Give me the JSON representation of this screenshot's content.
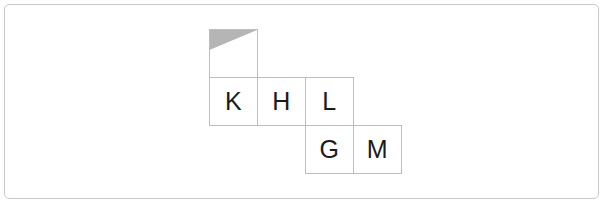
{
  "frame": {
    "border_color": "#c9c9c9",
    "background_color": "#ffffff",
    "corner_radius_px": 5
  },
  "board": {
    "cell_size_px": 49,
    "columns": 4,
    "rows": 3,
    "cell_border_color": "#bdbdbd",
    "cell_fill_color": "#ffffff",
    "letter_color": "#1b1b1b",
    "shade_color": "#b5b5b5",
    "cells": [
      {
        "id": "cell-r0c0",
        "row": 0,
        "col": 0,
        "letter": "",
        "shaded_corner": "top-left",
        "name": "shaded-marker-cell"
      },
      {
        "id": "cell-r1c0",
        "row": 1,
        "col": 0,
        "letter": "K",
        "shaded_corner": "",
        "name": "letter-cell-k"
      },
      {
        "id": "cell-r1c1",
        "row": 1,
        "col": 1,
        "letter": "H",
        "shaded_corner": "",
        "name": "letter-cell-h"
      },
      {
        "id": "cell-r1c2",
        "row": 1,
        "col": 2,
        "letter": "L",
        "shaded_corner": "",
        "name": "letter-cell-l"
      },
      {
        "id": "cell-r2c2",
        "row": 2,
        "col": 2,
        "letter": "G",
        "shaded_corner": "",
        "name": "letter-cell-g"
      },
      {
        "id": "cell-r2c3",
        "row": 2,
        "col": 3,
        "letter": "M",
        "shaded_corner": "",
        "name": "letter-cell-m"
      }
    ]
  }
}
